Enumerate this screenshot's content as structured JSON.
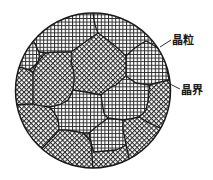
{
  "diagram": {
    "type": "grain-structure-micrograph-schematic",
    "circle": {
      "cx": 93,
      "cy": 90.5,
      "r": 77.5
    },
    "colors": {
      "line": "#1a1a1a",
      "background": "#ffffff",
      "hatch": "#2a2a2a"
    },
    "labels": [
      {
        "id": "grain",
        "text": "晶粒",
        "meaning": "grain",
        "x": 172,
        "y": 34
      },
      {
        "id": "grain-boundary",
        "text": "晶界",
        "meaning": "grain boundary",
        "x": 181,
        "y": 84
      }
    ],
    "hatch_styles": [
      "orthogonal-grid",
      "diagonal-grid"
    ]
  }
}
